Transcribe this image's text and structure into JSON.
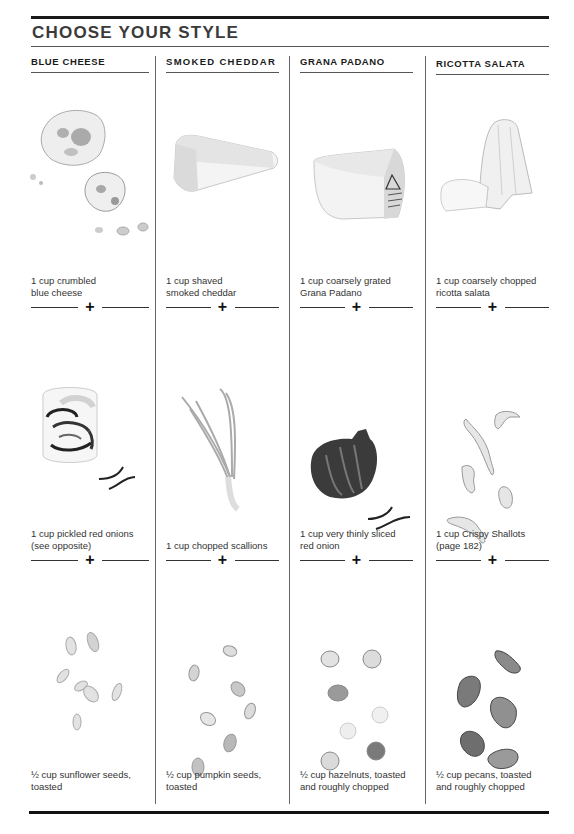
{
  "title": "CHOOSE YOUR STYLE",
  "columns": [
    {
      "name": "BLUE CHEESE",
      "cheese": "1 cup crumbled blue cheese",
      "cheese_lines": [
        "1 cup crumbled",
        "blue cheese"
      ],
      "onion_lines": [
        "1 cup pickled red onions",
        "(see opposite)"
      ],
      "nut_lines": [
        "½ cup sunflower seeds,",
        "toasted"
      ],
      "cheese_icon": "crumbled-blue-cheese-illustration",
      "onion_icon": "pickled-red-onions-jar-illustration",
      "nut_icon": "sunflower-seeds-illustration"
    },
    {
      "name": "SMOKED CHEDDAR",
      "cheese_lines": [
        "1 cup shaved",
        "smoked cheddar"
      ],
      "onion_lines": [
        "1 cup chopped scallions"
      ],
      "nut_lines": [
        "½ cup pumpkin seeds,",
        "toasted"
      ],
      "cheese_icon": "cheddar-wedge-illustration",
      "onion_icon": "scallions-illustration",
      "nut_icon": "pumpkin-seeds-illustration"
    },
    {
      "name": "GRANA PADANO",
      "cheese_lines": [
        "1 cup coarsely grated",
        "Grana Padano"
      ],
      "onion_lines": [
        "1 cup very thinly sliced",
        "red onion"
      ],
      "nut_lines": [
        "½ cup hazelnuts, toasted",
        "and roughly chopped"
      ],
      "cheese_icon": "grana-padano-wedge-illustration",
      "onion_icon": "red-onion-illustration",
      "nut_icon": "hazelnuts-illustration"
    },
    {
      "name": "RICOTTA SALATA",
      "cheese_lines": [
        "1 cup coarsely chopped",
        "ricotta salata"
      ],
      "onion_lines": [
        "1 cup Crispy Shallots",
        "(page 182)"
      ],
      "nut_lines": [
        "½ cup pecans, toasted",
        "and roughly chopped"
      ],
      "cheese_icon": "ricotta-salata-illustration",
      "onion_icon": "crispy-shallots-illustration",
      "nut_icon": "pecans-illustration"
    }
  ],
  "separator_symbol": "+"
}
